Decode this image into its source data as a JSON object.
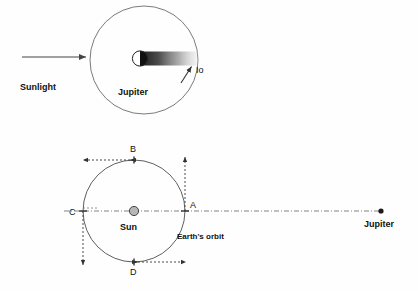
{
  "figure": {
    "title_internal": "Roemer's determination of the speed of light",
    "background_color": "#fefefe",
    "stroke_color": "#555555",
    "text_color": "#111111"
  },
  "top_diagram": {
    "name": "jupiter-io-shadow-diagram",
    "sunlight_label": "Sunlight",
    "planet_label": "Jupiter",
    "moon_label": "Io",
    "orbit": {
      "cx": 144,
      "cy": 60,
      "r": 54
    },
    "planet": {
      "cx": 140,
      "cy": 58,
      "r": 7.5
    },
    "shadow": {
      "x": 140,
      "y": 51,
      "width": 62,
      "height": 15
    },
    "sunlight_arrow": {
      "x1": 22,
      "y1": 57,
      "x2": 88,
      "y2": 57
    },
    "io_arrow": {
      "x1": 183,
      "y1": 80,
      "x2": 192,
      "y2": 67
    },
    "sunlight_label_pos": {
      "x": 20,
      "y": 89
    },
    "planet_label_pos": {
      "x": 119,
      "y": 94
    },
    "moon_label_pos": {
      "x": 196,
      "y": 72
    }
  },
  "bottom_diagram": {
    "name": "earth-orbit-jupiter-diagram",
    "sun_label": "Sun",
    "orbit_label": "Earth's orbit",
    "jupiter_label": "Jupiter",
    "orbit": {
      "cx": 134,
      "cy": 211,
      "r": 51
    },
    "sun": {
      "cx": 134,
      "cy": 211,
      "r": 4.5
    },
    "jupiter_dot": {
      "cx": 381,
      "cy": 211,
      "r": 2.5
    },
    "axis_line": {
      "x1": 66,
      "y1": 211,
      "x2": 381,
      "y2": 211
    },
    "points": [
      {
        "label": "A",
        "x": 185,
        "y": 211,
        "label_x": 191,
        "label_y": 207,
        "arrow": {
          "dir": "up",
          "x1": 185,
          "y1": 211,
          "x2": 185,
          "y2": 156
        }
      },
      {
        "label": "B",
        "x": 134,
        "y": 160,
        "label_x": 130,
        "label_y": 153,
        "arrow": {
          "dir": "left",
          "x1": 134,
          "y1": 160,
          "x2": 81,
          "y2": 160
        }
      },
      {
        "label": "C",
        "x": 83,
        "y": 211,
        "label_x": 71,
        "label_y": 214,
        "arrow": {
          "dir": "down",
          "x1": 83,
          "y1": 211,
          "x2": 83,
          "y2": 266
        }
      },
      {
        "label": "D",
        "x": 134,
        "y": 262,
        "label_x": 130,
        "label_y": 274,
        "arrow": {
          "dir": "right",
          "x1": 134,
          "y1": 262,
          "x2": 188,
          "y2": 262
        }
      }
    ],
    "sun_label_pos": {
      "x": 120,
      "y": 229
    },
    "orbit_label_pos": {
      "x": 177,
      "y": 238
    },
    "jupiter_label_pos": {
      "x": 366,
      "y": 226
    }
  }
}
